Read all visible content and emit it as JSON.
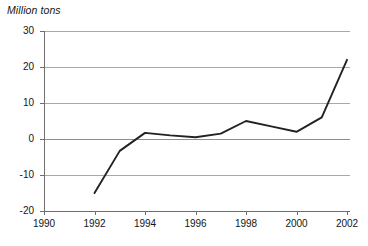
{
  "chart_data": {
    "type": "line",
    "title": "Million tons",
    "xlabel": "",
    "ylabel": "Million tons",
    "x": [
      1992,
      1993,
      1994,
      1995,
      1996,
      1997,
      1998,
      1999,
      2000,
      2001,
      2002
    ],
    "values": [
      -15,
      -3.3,
      1.7,
      1.0,
      0.5,
      1.5,
      5.0,
      3.5,
      2.0,
      6.0,
      22.0
    ],
    "series": [
      {
        "name": "Million tons",
        "values": [
          -15,
          -3.3,
          1.7,
          1.0,
          0.5,
          1.5,
          5.0,
          3.5,
          2.0,
          6.0,
          22.0
        ]
      }
    ],
    "xlim": [
      1990,
      2002
    ],
    "ylim": [
      -20,
      30
    ],
    "xticks": [
      1990,
      1992,
      1994,
      1996,
      1998,
      2000,
      2002
    ],
    "xtick_labels": [
      "1990",
      "1992",
      "1994",
      "1996",
      "1998",
      "2000",
      "2002"
    ],
    "yticks": [
      30,
      20,
      10,
      0,
      -10,
      -20
    ],
    "ytick_labels": [
      "30",
      "20",
      "10",
      "0",
      "-10",
      "-20"
    ],
    "grid": true,
    "grid_axis": "y",
    "legend": null,
    "line_color": "#222222",
    "grid_color": "#a8a8a8",
    "axis_color": "#6e6e6e",
    "background": "#ffffff"
  }
}
